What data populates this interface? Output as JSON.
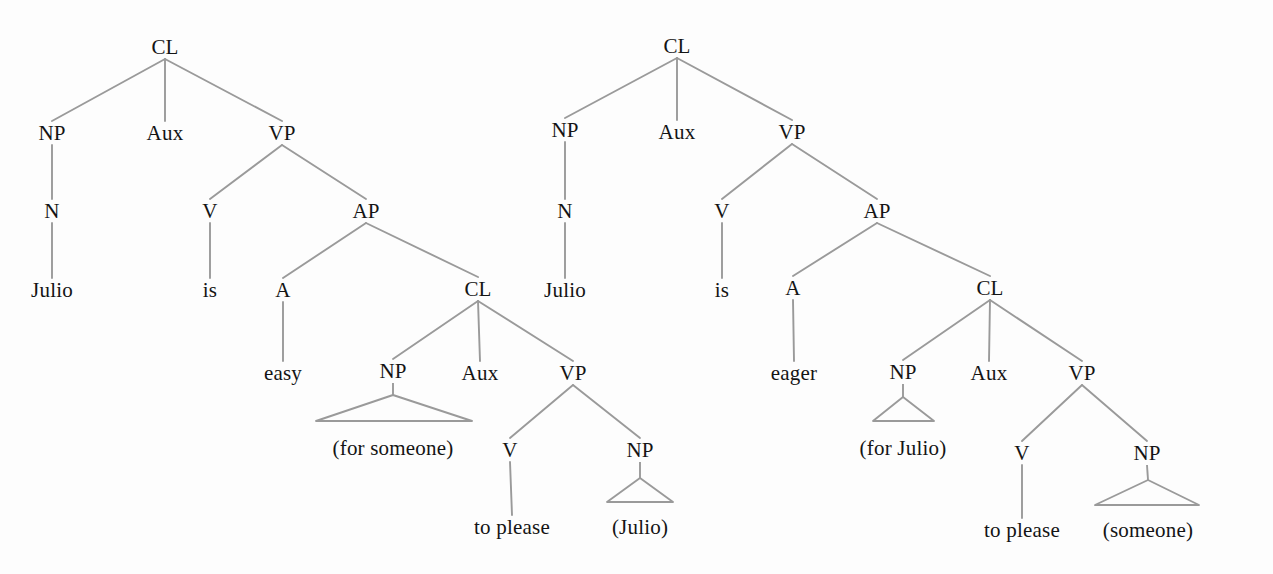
{
  "figure": {
    "background_color": "#fdfdfd",
    "edge_color": "#9a9a9a",
    "text_color": "#141414",
    "width": 1273,
    "height": 574
  },
  "trees": [
    {
      "id": "tree-easy",
      "sentence": "Julio is easy (for someone) to please (Julio)",
      "nodes": [
        {
          "id": "t1-cl",
          "label": "CL",
          "x": 165,
          "y": 47,
          "kind": "category"
        },
        {
          "id": "t1-np",
          "label": "NP",
          "x": 52,
          "y": 133,
          "kind": "category"
        },
        {
          "id": "t1-aux",
          "label": "Aux",
          "x": 165,
          "y": 133,
          "kind": "category"
        },
        {
          "id": "t1-vp",
          "label": "VP",
          "x": 282,
          "y": 133,
          "kind": "category"
        },
        {
          "id": "t1-n",
          "label": "N",
          "x": 52,
          "y": 211,
          "kind": "category"
        },
        {
          "id": "t1-v",
          "label": "V",
          "x": 210,
          "y": 211,
          "kind": "category"
        },
        {
          "id": "t1-ap",
          "label": "AP",
          "x": 366,
          "y": 211,
          "kind": "category"
        },
        {
          "id": "t1-julio",
          "label": "Julio",
          "x": 52,
          "y": 290,
          "kind": "terminal"
        },
        {
          "id": "t1-is",
          "label": "is",
          "x": 210,
          "y": 290,
          "kind": "terminal"
        },
        {
          "id": "t1-a",
          "label": "A",
          "x": 283,
          "y": 290,
          "kind": "category"
        },
        {
          "id": "t1-cl2",
          "label": "CL",
          "x": 478,
          "y": 289,
          "kind": "category"
        },
        {
          "id": "t1-easy",
          "label": "easy",
          "x": 283,
          "y": 373,
          "kind": "terminal"
        },
        {
          "id": "t1-np2",
          "label": "NP",
          "x": 393,
          "y": 371,
          "kind": "category"
        },
        {
          "id": "t1-aux2",
          "label": "Aux",
          "x": 480,
          "y": 373,
          "kind": "category"
        },
        {
          "id": "t1-vp2",
          "label": "VP",
          "x": 573,
          "y": 373,
          "kind": "category"
        },
        {
          "id": "t1-forsomeone",
          "label": "(for someone)",
          "x": 393,
          "y": 448,
          "kind": "terminal"
        },
        {
          "id": "t1-v2",
          "label": "V",
          "x": 510,
          "y": 450,
          "kind": "category"
        },
        {
          "id": "t1-np3",
          "label": "NP",
          "x": 640,
          "y": 450,
          "kind": "category"
        },
        {
          "id": "t1-toplease",
          "label": "to please",
          "x": 512,
          "y": 527,
          "kind": "terminal"
        },
        {
          "id": "t1-juliogap",
          "label": "(Julio)",
          "x": 640,
          "y": 527,
          "kind": "terminal"
        }
      ],
      "edges": [
        {
          "from": "t1-cl",
          "to": "t1-np"
        },
        {
          "from": "t1-cl",
          "to": "t1-aux"
        },
        {
          "from": "t1-cl",
          "to": "t1-vp"
        },
        {
          "from": "t1-np",
          "to": "t1-n"
        },
        {
          "from": "t1-vp",
          "to": "t1-v"
        },
        {
          "from": "t1-vp",
          "to": "t1-ap"
        },
        {
          "from": "t1-n",
          "to": "t1-julio"
        },
        {
          "from": "t1-v",
          "to": "t1-is"
        },
        {
          "from": "t1-ap",
          "to": "t1-a"
        },
        {
          "from": "t1-ap",
          "to": "t1-cl2"
        },
        {
          "from": "t1-a",
          "to": "t1-easy"
        },
        {
          "from": "t1-cl2",
          "to": "t1-np2"
        },
        {
          "from": "t1-cl2",
          "to": "t1-aux2"
        },
        {
          "from": "t1-cl2",
          "to": "t1-vp2"
        },
        {
          "from": "t1-vp2",
          "to": "t1-v2"
        },
        {
          "from": "t1-vp2",
          "to": "t1-np3"
        },
        {
          "from": "t1-v2",
          "to": "t1-toplease"
        }
      ],
      "triangles": [
        {
          "id": "t1-tri-forsomeone",
          "parent": "t1-np2",
          "apex_x": 393,
          "apex_y": 395,
          "left_x": 316,
          "right_x": 472,
          "base_y": 421
        },
        {
          "id": "t1-tri-juliogap",
          "parent": "t1-np3",
          "apex_x": 640,
          "apex_y": 478,
          "left_x": 607,
          "right_x": 673,
          "base_y": 502
        }
      ]
    },
    {
      "id": "tree-eager",
      "sentence": "Julio is eager (for Julio) to please (someone)",
      "nodes": [
        {
          "id": "t2-cl",
          "label": "CL",
          "x": 677,
          "y": 46,
          "kind": "category"
        },
        {
          "id": "t2-np",
          "label": "NP",
          "x": 565,
          "y": 130,
          "kind": "category"
        },
        {
          "id": "t2-aux",
          "label": "Aux",
          "x": 677,
          "y": 132,
          "kind": "category"
        },
        {
          "id": "t2-vp",
          "label": "VP",
          "x": 792,
          "y": 132,
          "kind": "category"
        },
        {
          "id": "t2-n",
          "label": "N",
          "x": 565,
          "y": 211,
          "kind": "category"
        },
        {
          "id": "t2-v",
          "label": "V",
          "x": 722,
          "y": 211,
          "kind": "category"
        },
        {
          "id": "t2-ap",
          "label": "AP",
          "x": 877,
          "y": 211,
          "kind": "category"
        },
        {
          "id": "t2-julio",
          "label": "Julio",
          "x": 565,
          "y": 290,
          "kind": "terminal"
        },
        {
          "id": "t2-is",
          "label": "is",
          "x": 722,
          "y": 290,
          "kind": "terminal"
        },
        {
          "id": "t2-a",
          "label": "A",
          "x": 793,
          "y": 288,
          "kind": "category"
        },
        {
          "id": "t2-cl2",
          "label": "CL",
          "x": 990,
          "y": 288,
          "kind": "category"
        },
        {
          "id": "t2-eager",
          "label": "eager",
          "x": 794,
          "y": 373,
          "kind": "terminal"
        },
        {
          "id": "t2-np2",
          "label": "NP",
          "x": 903,
          "y": 372,
          "kind": "category"
        },
        {
          "id": "t2-aux2",
          "label": "Aux",
          "x": 989,
          "y": 373,
          "kind": "category"
        },
        {
          "id": "t2-vp2",
          "label": "VP",
          "x": 1082,
          "y": 373,
          "kind": "category"
        },
        {
          "id": "t2-forjulio",
          "label": "(for Julio)",
          "x": 903,
          "y": 448,
          "kind": "terminal"
        },
        {
          "id": "t2-v2",
          "label": "V",
          "x": 1022,
          "y": 453,
          "kind": "category"
        },
        {
          "id": "t2-np3",
          "label": "NP",
          "x": 1147,
          "y": 453,
          "kind": "category"
        },
        {
          "id": "t2-toplease",
          "label": "to please",
          "x": 1022,
          "y": 530,
          "kind": "terminal"
        },
        {
          "id": "t2-someone",
          "label": "(someone)",
          "x": 1148,
          "y": 530,
          "kind": "terminal"
        }
      ],
      "edges": [
        {
          "from": "t2-cl",
          "to": "t2-np"
        },
        {
          "from": "t2-cl",
          "to": "t2-aux"
        },
        {
          "from": "t2-cl",
          "to": "t2-vp"
        },
        {
          "from": "t2-np",
          "to": "t2-n"
        },
        {
          "from": "t2-vp",
          "to": "t2-v"
        },
        {
          "from": "t2-vp",
          "to": "t2-ap"
        },
        {
          "from": "t2-n",
          "to": "t2-julio"
        },
        {
          "from": "t2-v",
          "to": "t2-is"
        },
        {
          "from": "t2-ap",
          "to": "t2-a"
        },
        {
          "from": "t2-ap",
          "to": "t2-cl2"
        },
        {
          "from": "t2-a",
          "to": "t2-eager"
        },
        {
          "from": "t2-cl2",
          "to": "t2-np2"
        },
        {
          "from": "t2-cl2",
          "to": "t2-aux2"
        },
        {
          "from": "t2-cl2",
          "to": "t2-vp2"
        },
        {
          "from": "t2-vp2",
          "to": "t2-v2"
        },
        {
          "from": "t2-vp2",
          "to": "t2-np3"
        },
        {
          "from": "t2-v2",
          "to": "t2-toplease"
        }
      ],
      "triangles": [
        {
          "id": "t2-tri-forjulio",
          "parent": "t2-np2",
          "apex_x": 903,
          "apex_y": 397,
          "left_x": 873,
          "right_x": 934,
          "base_y": 421
        },
        {
          "id": "t2-tri-someone",
          "parent": "t2-np3",
          "apex_x": 1148,
          "apex_y": 480,
          "left_x": 1095,
          "right_x": 1199,
          "base_y": 505
        }
      ]
    }
  ]
}
